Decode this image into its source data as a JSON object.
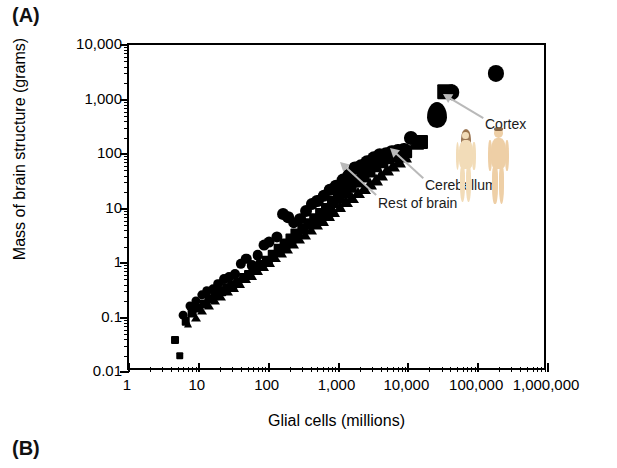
{
  "panels": {
    "a_label": "(A)",
    "b_label": "(B)"
  },
  "chart_data": {
    "type": "scatter",
    "title": "",
    "xlabel": "Glial cells (millions)",
    "ylabel": "Mass of brain structure (grams)",
    "xscale": "log",
    "yscale": "log",
    "xlim": [
      1,
      1000000
    ],
    "ylim": [
      0.01,
      10000
    ],
    "grid": false,
    "legend_position": "none",
    "xtick_labels": [
      "1",
      "10",
      "100",
      "1,000",
      "10,000",
      "100,000",
      "1,000,000"
    ],
    "xtick_values": [
      1,
      10,
      100,
      1000,
      10000,
      100000,
      1000000
    ],
    "ytick_labels": [
      "10,000",
      "1,000",
      "100",
      "10",
      "1",
      "0.1",
      "0.01"
    ],
    "ytick_values": [
      10000,
      1000,
      100,
      10,
      1,
      0.1,
      0.01
    ],
    "marker_color": "#000000",
    "annotation_arrow_color": "#b9b9b9",
    "series": [
      {
        "name": "Cortex",
        "marker": "circle",
        "points": [
          [
            6.0,
            0.11
          ],
          [
            7.5,
            0.16
          ],
          [
            9.0,
            0.2
          ],
          [
            11,
            0.26
          ],
          [
            13,
            0.3
          ],
          [
            16,
            0.33
          ],
          [
            19,
            0.42
          ],
          [
            23,
            0.5
          ],
          [
            27,
            0.55
          ],
          [
            33,
            0.62
          ],
          [
            40,
            0.95
          ],
          [
            48,
            1.2
          ],
          [
            58,
            0.9
          ],
          [
            70,
            1.4
          ],
          [
            85,
            2.1
          ],
          [
            100,
            2.4
          ],
          [
            130,
            3.0
          ],
          [
            160,
            8.0
          ],
          [
            190,
            7.0
          ],
          [
            230,
            5.5
          ],
          [
            280,
            6.5
          ],
          [
            340,
            9.0
          ],
          [
            420,
            12
          ],
          [
            500,
            14
          ],
          [
            620,
            17
          ],
          [
            760,
            22
          ],
          [
            930,
            26
          ],
          [
            1150,
            33
          ],
          [
            1400,
            42
          ],
          [
            1700,
            55
          ],
          [
            2100,
            60
          ],
          [
            2600,
            70
          ],
          [
            3200,
            85
          ],
          [
            3900,
            95
          ],
          [
            4800,
            100
          ],
          [
            5900,
            110
          ],
          [
            7200,
            115
          ],
          [
            8800,
            120
          ],
          [
            11000,
            195
          ],
          [
            42000,
            1350
          ],
          [
            180000,
            3000
          ]
        ]
      },
      {
        "name": "Cerebellum",
        "marker": "square",
        "points": [
          [
            4.5,
            0.038
          ],
          [
            5.3,
            0.02
          ],
          [
            6.5,
            0.085
          ],
          [
            8.0,
            0.12
          ],
          [
            9.5,
            0.15
          ],
          [
            12,
            0.18
          ],
          [
            14,
            0.22
          ],
          [
            17,
            0.25
          ],
          [
            21,
            0.3
          ],
          [
            25,
            0.35
          ],
          [
            30,
            0.4
          ],
          [
            36,
            0.45
          ],
          [
            44,
            0.52
          ],
          [
            53,
            0.6
          ],
          [
            64,
            0.75
          ],
          [
            78,
            0.9
          ],
          [
            95,
            1.1
          ],
          [
            115,
            1.4
          ],
          [
            140,
            1.8
          ],
          [
            170,
            2.2
          ],
          [
            210,
            2.8
          ],
          [
            250,
            3.4
          ],
          [
            310,
            4.2
          ],
          [
            380,
            5.2
          ],
          [
            460,
            6.5
          ],
          [
            560,
            8.0
          ],
          [
            680,
            10
          ],
          [
            830,
            13
          ],
          [
            1000,
            16
          ],
          [
            1250,
            20
          ],
          [
            1500,
            25
          ],
          [
            1850,
            32
          ],
          [
            2250,
            40
          ],
          [
            2750,
            50
          ],
          [
            3350,
            60
          ],
          [
            4100,
            72
          ],
          [
            5000,
            85
          ],
          [
            6100,
            95
          ],
          [
            7500,
            105
          ],
          [
            9000,
            110
          ],
          [
            15000,
            165
          ],
          [
            34000,
            1400
          ]
        ]
      },
      {
        "name": "Rest of brain",
        "marker": "triangle",
        "points": [
          [
            7.0,
            0.075
          ],
          [
            9.0,
            0.1
          ],
          [
            11,
            0.13
          ],
          [
            14,
            0.16
          ],
          [
            17,
            0.2
          ],
          [
            21,
            0.24
          ],
          [
            26,
            0.29
          ],
          [
            32,
            0.35
          ],
          [
            39,
            0.42
          ],
          [
            47,
            0.5
          ],
          [
            57,
            0.58
          ],
          [
            70,
            0.7
          ],
          [
            85,
            0.85
          ],
          [
            103,
            1.0
          ],
          [
            125,
            1.25
          ],
          [
            152,
            1.5
          ],
          [
            185,
            1.8
          ],
          [
            225,
            2.2
          ],
          [
            273,
            2.7
          ],
          [
            330,
            3.3
          ],
          [
            400,
            4.0
          ],
          [
            490,
            4.9
          ],
          [
            595,
            6.0
          ],
          [
            720,
            7.2
          ],
          [
            875,
            8.8
          ],
          [
            1060,
            10.5
          ],
          [
            1290,
            13
          ],
          [
            1560,
            15.5
          ],
          [
            1900,
            19
          ],
          [
            2300,
            23
          ],
          [
            2800,
            28
          ],
          [
            3400,
            34
          ],
          [
            4100,
            41
          ],
          [
            5000,
            50
          ],
          [
            6100,
            60
          ],
          [
            7400,
            72
          ],
          [
            9000,
            88
          ],
          [
            13000,
            150
          ],
          [
            26000,
            520
          ]
        ]
      }
    ],
    "annotations": [
      {
        "label": "Cortex",
        "label_x": 485,
        "label_y": 116,
        "arrow_from_x": 483,
        "arrow_from_y": 118,
        "arrow_to_x": 443,
        "arrow_to_y": 94
      },
      {
        "label": "Cerebellum",
        "label_x": 425,
        "label_y": 177,
        "arrow_from_x": 423,
        "arrow_from_y": 178,
        "arrow_to_x": 390,
        "arrow_to_y": 148
      },
      {
        "label": "Rest of brain",
        "label_x": 378,
        "label_y": 195,
        "arrow_from_x": 376,
        "arrow_from_y": 195,
        "arrow_to_x": 340,
        "arrow_to_y": 162
      }
    ],
    "figures": [
      {
        "name": "female-figure",
        "x": 455,
        "y": 130,
        "height": 72,
        "skin": "#f2dcb8",
        "hair": "#8c6239"
      },
      {
        "name": "male-figure",
        "x": 487,
        "y": 128,
        "height": 76,
        "skin": "#eecfa6",
        "hair": "#6b4a2b"
      }
    ]
  }
}
